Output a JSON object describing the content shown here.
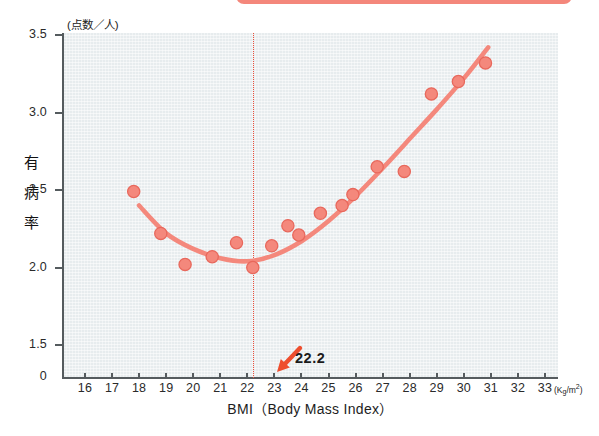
{
  "figure": {
    "y_axis_unit": "(点数／人)",
    "y_axis_title_chars": [
      "有",
      "病",
      "率"
    ],
    "x_axis_title": "BMI（Body Mass Index）",
    "x_axis_unit_prefix": "(K",
    "x_axis_unit_sub": "g",
    "x_axis_unit_rest": "/m",
    "x_axis_unit_sup": "2",
    "annotation_label": "22.2",
    "colors": {
      "marker": "#f4887c",
      "marker_edge": "#e8685c",
      "curve": "#f4887c",
      "threshold": "#ec4f3a",
      "arrow": "#ee4e2e",
      "panel_bg": "#e7ecee",
      "axis": "#555b5e",
      "banner": "#f4877b"
    }
  },
  "chart_data": {
    "type": "scatter",
    "title": "",
    "subtitle": "",
    "xlabel": "BMI（Body Mass Index）",
    "ylabel": "有病率",
    "ylabel_unit": "(点数／人)",
    "xlabel_unit": "(Kg/m2)",
    "xlim": [
      15.3,
      33.7
    ],
    "ylim": [
      1.32,
      3.5
    ],
    "y_axis_break": true,
    "y_zero_shown": true,
    "xticks": [
      16,
      17,
      18,
      19,
      20,
      21,
      22,
      23,
      24,
      25,
      26,
      27,
      28,
      29,
      30,
      31,
      32,
      33
    ],
    "xtick_labels": [
      "16",
      "17",
      "18",
      "19",
      "20",
      "21",
      "22",
      "23",
      "24",
      "25",
      "26",
      "27",
      "28",
      "29",
      "30",
      "31",
      "32",
      "33"
    ],
    "yticks": [
      0,
      1.5,
      2.0,
      2.5,
      3.0,
      3.5
    ],
    "ytick_labels": [
      "0",
      "1.5",
      "2.0",
      "2.5",
      "3.0",
      "3.5"
    ],
    "grid": false,
    "legend": false,
    "threshold_line": {
      "x": 22.2,
      "style": "dotted",
      "label": "22.2"
    },
    "points": [
      {
        "x": 17.8,
        "y": 2.49
      },
      {
        "x": 18.8,
        "y": 2.22
      },
      {
        "x": 19.7,
        "y": 2.02
      },
      {
        "x": 20.7,
        "y": 2.07
      },
      {
        "x": 21.6,
        "y": 2.16
      },
      {
        "x": 22.2,
        "y": 2.0
      },
      {
        "x": 22.9,
        "y": 2.14
      },
      {
        "x": 23.5,
        "y": 2.27
      },
      {
        "x": 23.9,
        "y": 2.21
      },
      {
        "x": 24.7,
        "y": 2.35
      },
      {
        "x": 25.5,
        "y": 2.4
      },
      {
        "x": 25.9,
        "y": 2.47
      },
      {
        "x": 26.8,
        "y": 2.65
      },
      {
        "x": 27.8,
        "y": 2.62
      },
      {
        "x": 28.8,
        "y": 3.12
      },
      {
        "x": 29.8,
        "y": 3.2
      },
      {
        "x": 30.8,
        "y": 3.32
      }
    ],
    "fit_curve": {
      "kind": "quadratic",
      "points": [
        {
          "x": 18.0,
          "y": 2.4
        },
        {
          "x": 19.0,
          "y": 2.22
        },
        {
          "x": 20.0,
          "y": 2.12
        },
        {
          "x": 21.0,
          "y": 2.06
        },
        {
          "x": 22.0,
          "y": 2.04
        },
        {
          "x": 23.0,
          "y": 2.08
        },
        {
          "x": 24.0,
          "y": 2.17
        },
        {
          "x": 25.0,
          "y": 2.3
        },
        {
          "x": 26.0,
          "y": 2.46
        },
        {
          "x": 27.0,
          "y": 2.64
        },
        {
          "x": 28.0,
          "y": 2.83
        },
        {
          "x": 29.0,
          "y": 3.02
        },
        {
          "x": 30.0,
          "y": 3.22
        },
        {
          "x": 30.9,
          "y": 3.42
        }
      ]
    }
  }
}
